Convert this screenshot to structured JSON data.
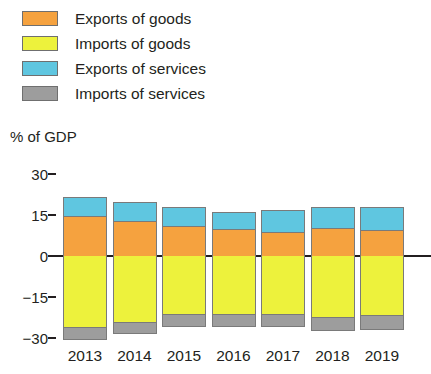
{
  "chart_data": {
    "type": "bar",
    "subtype": "stacked-diverging",
    "title": "",
    "subtitle": "",
    "xlabel": "",
    "ylabel": "% of GDP",
    "ylim": [
      -30,
      30
    ],
    "yticks": [
      30,
      15,
      0,
      -15,
      -30
    ],
    "ytick_labels": [
      "30",
      "15",
      "0",
      "−15",
      "−30"
    ],
    "grid": false,
    "legend_position": "top-left",
    "categories": [
      "2013",
      "2014",
      "2015",
      "2016",
      "2017",
      "2018",
      "2019"
    ],
    "series": [
      {
        "name": "Exports of goods",
        "color": "#F5A23F",
        "direction": "positive",
        "values": [
          14.7,
          12.9,
          11.0,
          9.9,
          8.8,
          10.3,
          9.6
        ]
      },
      {
        "name": "Exports of services",
        "color": "#5FC6E0",
        "direction": "positive",
        "values": [
          7.0,
          7.0,
          7.0,
          6.3,
          8.1,
          7.7,
          8.5
        ]
      },
      {
        "name": "Imports of goods",
        "color": "#EDF23C",
        "direction": "negative",
        "values": [
          26.1,
          24.3,
          21.3,
          21.3,
          21.3,
          22.4,
          21.7
        ]
      },
      {
        "name": "Imports of services",
        "color": "#9D9D9D",
        "direction": "negative",
        "values": [
          4.8,
          4.4,
          4.8,
          4.8,
          4.8,
          5.1,
          5.5
        ]
      }
    ]
  },
  "legend": {
    "items": [
      {
        "label": "Exports of goods",
        "color": "#F5A23F"
      },
      {
        "label": "Imports of goods",
        "color": "#EDF23C"
      },
      {
        "label": "Exports of services",
        "color": "#5FC6E0"
      },
      {
        "label": "Imports of services",
        "color": "#9D9D9D"
      }
    ]
  },
  "axis": {
    "caption": "% of GDP"
  }
}
